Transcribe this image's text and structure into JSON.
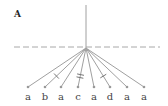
{
  "panel": {
    "label": "A"
  },
  "colors": {
    "line": "#a0a0a0",
    "dashed": "#a8a8a8",
    "text": "#444444",
    "panel_label": "#222222"
  },
  "tree": {
    "type": "star-phylogeny",
    "root": {
      "x": 86,
      "y": 5
    },
    "hub": {
      "x": 86,
      "y": 48
    },
    "baseline_y": 47,
    "leaves": [
      {
        "label": "a",
        "x": 28,
        "ticks": 0
      },
      {
        "label": "b",
        "x": 45,
        "ticks": 1
      },
      {
        "label": "a",
        "x": 61,
        "ticks": 0
      },
      {
        "label": "c",
        "x": 78,
        "ticks": 2
      },
      {
        "label": "a",
        "x": 94,
        "ticks": 0
      },
      {
        "label": "d",
        "x": 110,
        "ticks": 1
      },
      {
        "label": "a",
        "x": 127,
        "ticks": 0
      },
      {
        "label": "a",
        "x": 144,
        "ticks": 0
      }
    ]
  }
}
